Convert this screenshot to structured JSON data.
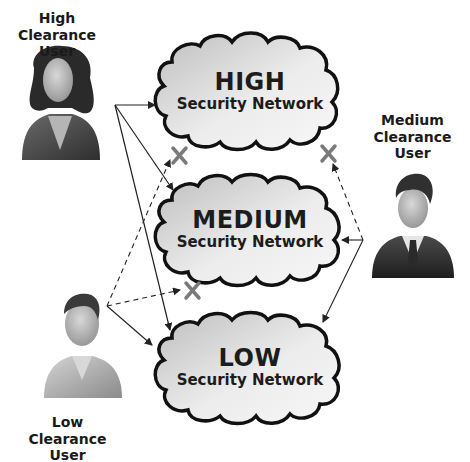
{
  "diagram": {
    "title": "",
    "users": [
      {
        "id": "high",
        "line1": "High",
        "line2": "Clearance User",
        "gender": "female"
      },
      {
        "id": "medium",
        "line1": "Medium",
        "line2": "Clearance User",
        "gender": "male-suit"
      },
      {
        "id": "low",
        "line1": "Low",
        "line2": "Clearance User",
        "gender": "male-casual"
      }
    ],
    "networks": [
      {
        "id": "high",
        "level": "HIGH",
        "subtitle": "Security Network"
      },
      {
        "id": "medium",
        "level": "MEDIUM",
        "subtitle": "Security Network"
      },
      {
        "id": "low",
        "level": "LOW",
        "subtitle": "Security Network"
      }
    ],
    "connections": [
      {
        "from": "High Clearance User",
        "to": "HIGH Security Network",
        "style": "solid",
        "allowed": true
      },
      {
        "from": "High Clearance User",
        "to": "MEDIUM Security Network",
        "style": "solid",
        "allowed": true
      },
      {
        "from": "High Clearance User",
        "to": "LOW Security Network",
        "style": "solid",
        "allowed": true
      },
      {
        "from": "Medium Clearance User",
        "to": "HIGH Security Network",
        "style": "dashed",
        "allowed": false
      },
      {
        "from": "Medium Clearance User",
        "to": "MEDIUM Security Network",
        "style": "solid",
        "allowed": true
      },
      {
        "from": "Medium Clearance User",
        "to": "LOW Security Network",
        "style": "solid",
        "allowed": true
      },
      {
        "from": "Low Clearance User",
        "to": "HIGH Security Network",
        "style": "dashed",
        "allowed": false
      },
      {
        "from": "Low Clearance User",
        "to": "MEDIUM Security Network",
        "style": "dashed",
        "allowed": false
      },
      {
        "from": "Low Clearance User",
        "to": "LOW Security Network",
        "style": "solid",
        "allowed": true
      }
    ],
    "colors": {
      "cloud_fill_light": "#f4f4f4",
      "cloud_fill_dark": "#b4b4b4",
      "cloud_outline": "#111111",
      "arrow": "#222222",
      "deny_mark": "#7a7a7a"
    }
  }
}
